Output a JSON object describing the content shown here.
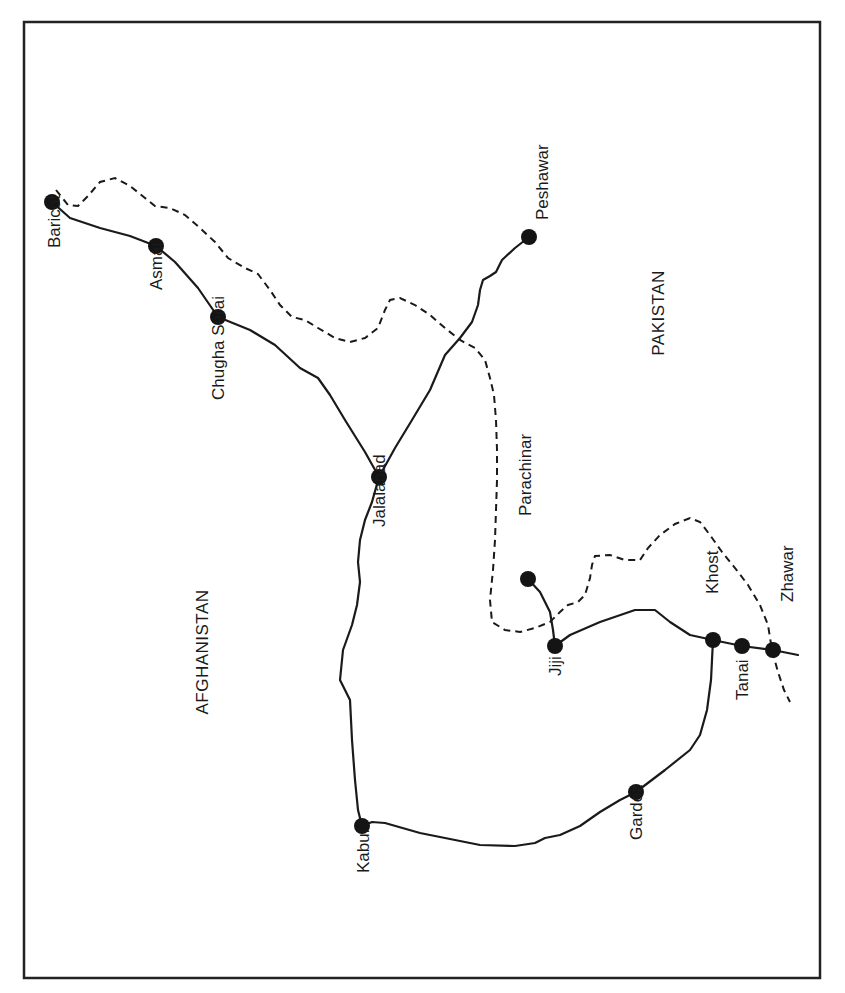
{
  "map": {
    "frame": {
      "x": 24,
      "y": 22,
      "width": 796,
      "height": 956
    },
    "colors": {
      "ink": "#1a1a1a",
      "background": "#ffffff"
    },
    "countries": [
      {
        "id": "afghanistan",
        "label": "AFGHANISTAN",
        "x": 208,
        "y": 652
      },
      {
        "id": "pakistan",
        "label": "PAKISTAN",
        "x": 664,
        "y": 313
      }
    ],
    "cities": [
      {
        "id": "baricot",
        "label": "Baricot",
        "x": 52,
        "y": 202,
        "lx": 60,
        "ly": 248
      },
      {
        "id": "asmar",
        "label": "Asmar",
        "x": 156,
        "y": 246,
        "lx": 162,
        "ly": 290
      },
      {
        "id": "chugha-serai",
        "label": "Chugha Serai",
        "x": 218,
        "y": 317,
        "lx": 224,
        "ly": 400
      },
      {
        "id": "jalalabad",
        "label": "Jalalabad",
        "x": 379,
        "y": 477,
        "lx": 385,
        "ly": 527
      },
      {
        "id": "peshawar",
        "label": "Peshawar",
        "x": 529,
        "y": 237,
        "lx": 548,
        "ly": 220
      },
      {
        "id": "parachinar",
        "label": "Parachinar",
        "x": 528,
        "y": 579,
        "lx": 531,
        "ly": 516
      },
      {
        "id": "jiji",
        "label": "Jiji",
        "x": 555,
        "y": 646,
        "lx": 561,
        "ly": 676
      },
      {
        "id": "khost",
        "label": "Khost",
        "x": 713,
        "y": 640,
        "lx": 718,
        "ly": 594
      },
      {
        "id": "tanai",
        "label": "Tanai",
        "x": 742,
        "y": 646,
        "lx": 748,
        "ly": 700
      },
      {
        "id": "zhawar",
        "label": "Zhawar",
        "x": 773,
        "y": 650,
        "lx": 793,
        "ly": 602
      },
      {
        "id": "gardez",
        "label": "Gardez",
        "x": 636,
        "y": 792,
        "lx": 642,
        "ly": 840
      },
      {
        "id": "kabul",
        "label": "Kabul",
        "x": 362,
        "y": 826,
        "lx": 369,
        "ly": 873
      }
    ],
    "roads": [
      {
        "id": "baricot-jalalabad",
        "d": "M52,202 L70,218 L100,228 L130,236 L156,246 L175,262 L198,288 L218,317 L250,330 L275,345 L300,368 L318,378 L330,395 L345,420 L365,452 L379,477"
      },
      {
        "id": "jalalabad-peshawar",
        "d": "M379,477 L395,448 L412,420 L430,390 L445,355 L460,338 L472,322 L478,305 L480,290 L483,280 L490,276 L496,272 L502,260 L515,248 L529,237"
      },
      {
        "id": "jalalabad-kabul",
        "d": "M379,477 L372,502 L365,520 L360,540 L358,562 L360,582 L357,605 L352,625 L343,650 L340,680 L350,700 L352,740 L355,780 L358,810 L362,826"
      },
      {
        "id": "kabul-gardez-khost",
        "d": "M362,826 L372,822 L385,823 L420,833 L480,845 L515,846 L535,843 L545,838 L560,835 L580,826 L600,812 L620,800 L636,792 L665,770 L690,750 L700,735 L707,710 L711,680 L713,640"
      },
      {
        "id": "jiji-khost-zhawar",
        "d": "M555,646 L570,635 L600,622 L635,610 L655,610 L670,622 L690,635 L713,640 L742,646 L773,650 L798,655"
      },
      {
        "id": "parachinar-jiji",
        "d": "M528,579 L540,592 L550,612 L553,630 L555,646"
      }
    ],
    "borders": [
      {
        "id": "border-north",
        "d": "M56,190 L68,205 L78,206 L88,196 L100,182 L115,178 L130,186 L145,198 L155,206 L170,208 L185,215 L200,228 L215,242 L228,258 L245,268 L258,274 L270,290 L280,305 L292,317 L305,320 L318,328 L335,338 L350,342 L365,338 L378,328 L385,310 L390,300 L400,298 L415,305 L430,315 L445,328 L460,340 L475,348 L485,360 L490,378 L494,395 L496,420 L497,450 L497,480 L496,510 L495,540 L493,570 L490,600 L492,622 L505,630 L520,632 L535,628 L550,622 L560,612 L568,605 L578,602 L585,595 L590,578 L592,565 L595,556 L610,555 L625,560 L640,560 L648,548 L660,535 L675,524 L690,518 L700,522 L710,535 L722,552 L735,568 L748,585 L760,605 L768,625 L772,650 L778,672 L784,690 L790,702"
      }
    ]
  }
}
